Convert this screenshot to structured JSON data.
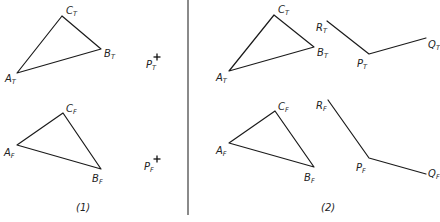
{
  "figure": {
    "panels": [
      {
        "id": "panel-1",
        "caption": "(1)",
        "caption_pos": [
          76,
          211
        ],
        "triangles": [
          {
            "name": "T",
            "vertices": {
              "A": [
                17,
                73
              ],
              "B": [
                101,
                49
              ],
              "C": [
                62,
                16
              ]
            },
            "labels": [
              {
                "main": "A",
                "sub": "T",
                "pos": [
                  5,
                  82
                ]
              },
              {
                "main": "B",
                "sub": "T",
                "pos": [
                  104,
                  57
                ]
              },
              {
                "main": "C",
                "sub": "T",
                "pos": [
                  66,
                  14
                ]
              }
            ]
          },
          {
            "name": "F",
            "vertices": {
              "A": [
                17,
                145
              ],
              "B": [
                101,
                169
              ],
              "C": [
                63,
                113
              ]
            },
            "labels": [
              {
                "main": "A",
                "sub": "F",
                "pos": [
                  4,
                  156
                ]
              },
              {
                "main": "B",
                "sub": "F",
                "pos": [
                  92,
                  182
                ]
              },
              {
                "main": "C",
                "sub": "F",
                "pos": [
                  66,
                  112
                ]
              }
            ]
          }
        ],
        "points": [
          {
            "main": "P",
            "sub": "T",
            "label_pos": [
              146,
              68
            ],
            "cross": [
              157,
              57
            ]
          },
          {
            "main": "P",
            "sub": "F",
            "label_pos": [
              144,
              170
            ],
            "cross": [
              157,
              159
            ]
          }
        ]
      },
      {
        "id": "panel-2",
        "caption": "(2)",
        "caption_pos": [
          321,
          211
        ],
        "triangles": [
          {
            "name": "T",
            "vertices": {
              "A": [
                229,
                71
              ],
              "B": [
                314,
                47
              ],
              "C": [
                274,
                15
              ]
            },
            "labels": [
              {
                "main": "A",
                "sub": "T",
                "pos": [
                  216,
                  81
                ]
              },
              {
                "main": "B",
                "sub": "T",
                "pos": [
                  317,
                  56
                ]
              },
              {
                "main": "C",
                "sub": "T",
                "pos": [
                  278,
                  13
                ]
              }
            ]
          },
          {
            "name": "F",
            "vertices": {
              "A": [
                229,
                143
              ],
              "B": [
                314,
                167
              ],
              "C": [
                275,
                111
              ]
            },
            "labels": [
              {
                "main": "A",
                "sub": "F",
                "pos": [
                  216,
                  154
                ]
              },
              {
                "main": "B",
                "sub": "F",
                "pos": [
                  304,
                  181
                ]
              },
              {
                "main": "C",
                "sub": "F",
                "pos": [
                  278,
                  110
                ]
              }
            ]
          }
        ],
        "polylines": [
          {
            "name": "T",
            "points": {
              "R": [
                327,
                21
              ],
              "P": [
                369,
                54
              ],
              "Q": [
                426,
                38
              ]
            },
            "labels": [
              {
                "main": "R",
                "sub": "T",
                "pos": [
                  316,
                  31
                ]
              },
              {
                "main": "P",
                "sub": "T",
                "pos": [
                  357,
                  67
                ]
              },
              {
                "main": "Q",
                "sub": "T",
                "pos": [
                  428,
                  48
                ]
              }
            ]
          },
          {
            "name": "F",
            "points": {
              "R": [
                328,
                100
              ],
              "P": [
                369,
                158
              ],
              "Q": [
                426,
                174
              ]
            },
            "labels": [
              {
                "main": "R",
                "sub": "F",
                "pos": [
                  316,
                  109
                ]
              },
              {
                "main": "P",
                "sub": "F",
                "pos": [
                  356,
                  171
                ]
              },
              {
                "main": "Q",
                "sub": "F",
                "pos": [
                  428,
                  177
                ]
              }
            ]
          }
        ]
      }
    ],
    "divider": {
      "x": 188,
      "y1": 0,
      "y2": 215
    }
  }
}
